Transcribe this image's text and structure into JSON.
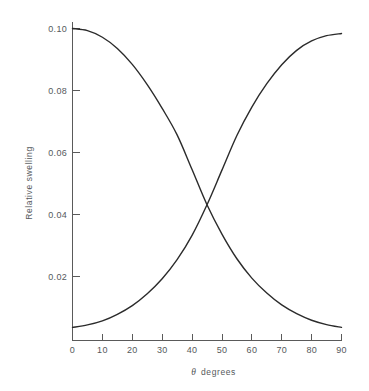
{
  "chart_data": {
    "type": "line",
    "title": "",
    "subtitle": "",
    "xlabel_symbol": "θ",
    "xlabel_text": "degrees",
    "xlabel": "θ degrees",
    "ylabel": "Relative swelling",
    "xlim": [
      0,
      90
    ],
    "ylim": [
      0,
      0.1035
    ],
    "xticks": [
      0,
      10,
      20,
      30,
      40,
      50,
      60,
      70,
      80,
      90
    ],
    "xtick_labels": [
      "0",
      "10",
      "20",
      "30",
      "40",
      "50",
      "60",
      "70",
      "80",
      "90"
    ],
    "yticks": [
      0.02,
      0.04,
      0.06,
      0.08,
      0.1
    ],
    "ytick_labels": [
      "0.02",
      "0.04",
      "0.06",
      "0.08",
      "0.10"
    ],
    "grid": false,
    "legend": "none",
    "line_color": "#2b2b2b",
    "axis_color": "#5a5a5a",
    "background_color": "#ffffff",
    "crossing_point": {
      "x": 45,
      "y": 0.0435
    },
    "x": [
      0,
      5,
      10,
      15,
      20,
      25,
      30,
      35,
      40,
      45,
      50,
      55,
      60,
      65,
      70,
      75,
      80,
      85,
      90
    ],
    "series": [
      {
        "name": "descending",
        "values": [
          0.1,
          0.0993,
          0.0972,
          0.0936,
          0.0885,
          0.082,
          0.0744,
          0.0659,
          0.0548,
          0.0435,
          0.0341,
          0.0262,
          0.02,
          0.0152,
          0.0114,
          0.0086,
          0.0065,
          0.0051,
          0.0042
        ]
      },
      {
        "name": "ascending",
        "values": [
          0.0042,
          0.005,
          0.0063,
          0.0084,
          0.0112,
          0.015,
          0.0198,
          0.0259,
          0.0337,
          0.0435,
          0.0546,
          0.0657,
          0.0748,
          0.0823,
          0.0884,
          0.093,
          0.096,
          0.0977,
          0.0984
        ]
      }
    ]
  }
}
